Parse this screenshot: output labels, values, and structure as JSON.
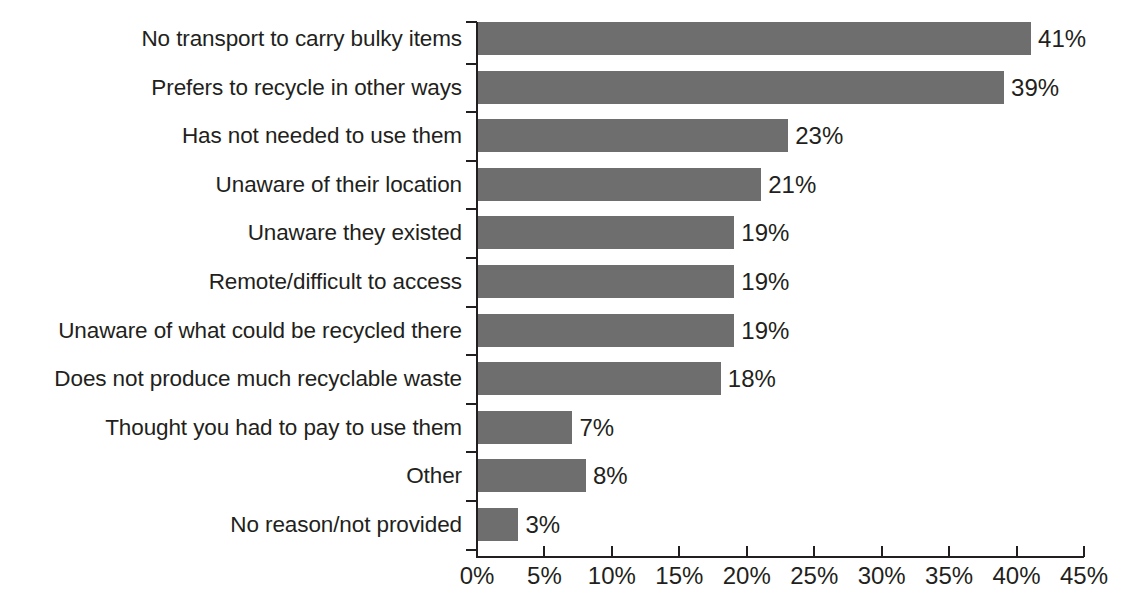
{
  "chart_data": {
    "type": "bar",
    "orientation": "horizontal",
    "title": "",
    "subtitle": "",
    "xlabel": "",
    "ylabel": "",
    "xlim": [
      0,
      45
    ],
    "grid": false,
    "legend": false,
    "value_suffix": "%",
    "bar_color": "#6e6e6e",
    "text_color": "#231f20",
    "axis_color": "#231f20",
    "background": "#ffffff",
    "x_ticks": [
      0,
      5,
      10,
      15,
      20,
      25,
      30,
      35,
      40,
      45
    ],
    "x_tick_labels": [
      "0%",
      "5%",
      "10%",
      "15%",
      "20%",
      "25%",
      "30%",
      "35%",
      "40%",
      "45%"
    ],
    "categories": [
      "No transport to carry bulky items",
      "Prefers to recycle in other ways",
      "Has not needed to use them",
      "Unaware of their location",
      "Unaware they existed",
      "Remote/difficult to access",
      "Unaware of what could be recycled there",
      "Does not produce much recyclable waste",
      "Thought you had to pay to use them",
      "Other",
      "No reason/not provided"
    ],
    "values": [
      41,
      39,
      23,
      21,
      19,
      19,
      19,
      18,
      7,
      8,
      3
    ],
    "data_labels": [
      "41%",
      "39%",
      "23%",
      "21%",
      "19%",
      "19%",
      "19%",
      "18%",
      "7%",
      "8%",
      "3%"
    ]
  }
}
